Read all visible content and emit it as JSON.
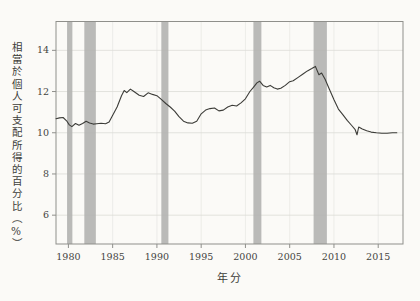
{
  "figure": {
    "background": "#fbfaf7",
    "frame_color": "#8f8f8b",
    "h_grid_color": "#dcdcd7",
    "v_grid_color": "#e9e9e4",
    "text_color": "#44443f"
  },
  "chart_data": {
    "type": "line",
    "title": "",
    "xlabel": "年分",
    "ylabel": "相當於個人可支配所得的百分比（%）",
    "x_tick_labels": [
      "1980",
      "1985",
      "1990",
      "1995",
      "2000",
      "2005",
      "2010",
      "2015"
    ],
    "x_tick_values": [
      1980,
      1985,
      1990,
      1995,
      2000,
      2005,
      2010,
      2015
    ],
    "y_tick_labels": [
      "14",
      "12",
      "10",
      "8",
      "6"
    ],
    "y_tick_values": [
      14,
      12,
      10,
      8,
      6
    ],
    "xlim": [
      1978.6,
      2017.8
    ],
    "ylim": [
      4.6,
      15.4
    ],
    "grid": "both",
    "legend": "none",
    "line_color": "#3c3c38",
    "band_color": "#b3b3b0",
    "recession_bands": [
      [
        1979.85,
        1980.45
      ],
      [
        1981.8,
        1983.1
      ],
      [
        1990.5,
        1991.3
      ],
      [
        2000.9,
        2001.8
      ],
      [
        2007.7,
        2009.2
      ]
    ],
    "series": [
      {
        "x": [
          1978.6,
          1979.0,
          1979.4,
          1979.8,
          1980.1,
          1980.4,
          1980.8,
          1981.2,
          1981.6,
          1982.0,
          1982.4,
          1982.8,
          1983.2,
          1983.7,
          1984.2,
          1984.6,
          1985.0,
          1985.5,
          1986.0,
          1986.3,
          1986.6,
          1987.0,
          1987.4,
          1988.0,
          1988.5,
          1989.0,
          1989.5,
          1990.0,
          1990.5,
          1991.0,
          1991.5,
          1992.0,
          1992.5,
          1993.0,
          1993.5,
          1994.0,
          1994.5,
          1995.0,
          1995.5,
          1996.0,
          1996.5,
          1997.0,
          1997.5,
          1998.0,
          1998.5,
          1999.0,
          1999.5,
          2000.0,
          2000.5,
          2000.9,
          2001.3,
          2001.6,
          2002.0,
          2002.4,
          2002.8,
          2003.2,
          2003.6,
          2004.0,
          2004.5,
          2005.0,
          2005.4,
          2006.0,
          2006.5,
          2007.0,
          2007.5,
          2007.9,
          2008.3,
          2008.6,
          2009.0,
          2009.5,
          2010.0,
          2010.5,
          2011.0,
          2011.5,
          2012.0,
          2012.4,
          2012.6,
          2012.8,
          2013.2,
          2013.7,
          2014.2,
          2014.8,
          2015.4,
          2016.0,
          2016.6,
          2017.1
        ],
        "y": [
          10.68,
          10.72,
          10.74,
          10.58,
          10.38,
          10.3,
          10.45,
          10.36,
          10.45,
          10.56,
          10.48,
          10.42,
          10.44,
          10.46,
          10.44,
          10.52,
          10.85,
          11.25,
          11.8,
          12.05,
          11.95,
          12.12,
          12.0,
          11.82,
          11.76,
          11.94,
          11.86,
          11.8,
          11.62,
          11.42,
          11.25,
          11.05,
          10.78,
          10.56,
          10.48,
          10.46,
          10.56,
          10.92,
          11.1,
          11.17,
          11.2,
          11.06,
          11.1,
          11.25,
          11.33,
          11.3,
          11.45,
          11.65,
          12.0,
          12.2,
          12.42,
          12.5,
          12.3,
          12.22,
          12.3,
          12.18,
          12.12,
          12.16,
          12.3,
          12.48,
          12.52,
          12.7,
          12.85,
          13.0,
          13.12,
          13.22,
          12.82,
          12.9,
          12.6,
          12.1,
          11.6,
          11.15,
          10.88,
          10.6,
          10.35,
          10.15,
          9.9,
          10.28,
          10.18,
          10.1,
          10.03,
          10.0,
          9.98,
          9.98,
          10.0,
          10.0
        ]
      }
    ]
  }
}
